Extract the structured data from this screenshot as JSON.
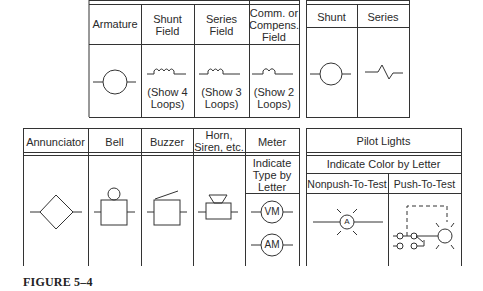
{
  "figure": {
    "caption": "FIGURE 5–4"
  },
  "motor_table": {
    "headers": [
      {
        "line1": "Armature",
        "line2": ""
      },
      {
        "line1": "Shunt",
        "line2": "Field"
      },
      {
        "line1": "Series",
        "line2": "Field"
      },
      {
        "line1": "Comm. or",
        "line2": "Compens.",
        "line3": "Field"
      }
    ],
    "notes": [
      {
        "line1": "",
        "line2": ""
      },
      {
        "line1": "(Show 4",
        "line2": "Loops)"
      },
      {
        "line1": "(Show 3",
        "line2": "Loops)"
      },
      {
        "line1": "(Show 2",
        "line2": "Loops)"
      }
    ],
    "symbols": [
      "armature-circle",
      "shunt-field-coil-4-loops",
      "series-field-coil-3-loops",
      "comm-field-coil-2-loops"
    ]
  },
  "generator_table": {
    "headers": [
      "Shunt",
      "Series"
    ],
    "symbols": [
      "shunt-circle",
      "series-zigzag"
    ]
  },
  "alarm_table": {
    "headers": [
      {
        "line1": "Annunciator",
        "line2": ""
      },
      {
        "line1": "Bell",
        "line2": ""
      },
      {
        "line1": "Buzzer",
        "line2": ""
      },
      {
        "line1": "Horn,",
        "line2": "Siren, etc."
      },
      {
        "line1": "Meter",
        "line2": ""
      }
    ],
    "meter_note": {
      "line1": "Indicate",
      "line2": "Type by",
      "line3": "Letter"
    },
    "meter_labels": [
      "VM",
      "AM"
    ],
    "symbols": [
      "annunciator-diamond",
      "bell",
      "buzzer",
      "horn",
      "meter"
    ]
  },
  "pilot_table": {
    "title": "Pilot Lights",
    "subtitle": "Indicate Color by Letter",
    "headers": [
      "Nonpush-To-Test",
      "Push-To-Test"
    ],
    "lamp_label": "A",
    "symbols": [
      "nonpush-to-test-lamp",
      "push-to-test-lamp"
    ]
  }
}
